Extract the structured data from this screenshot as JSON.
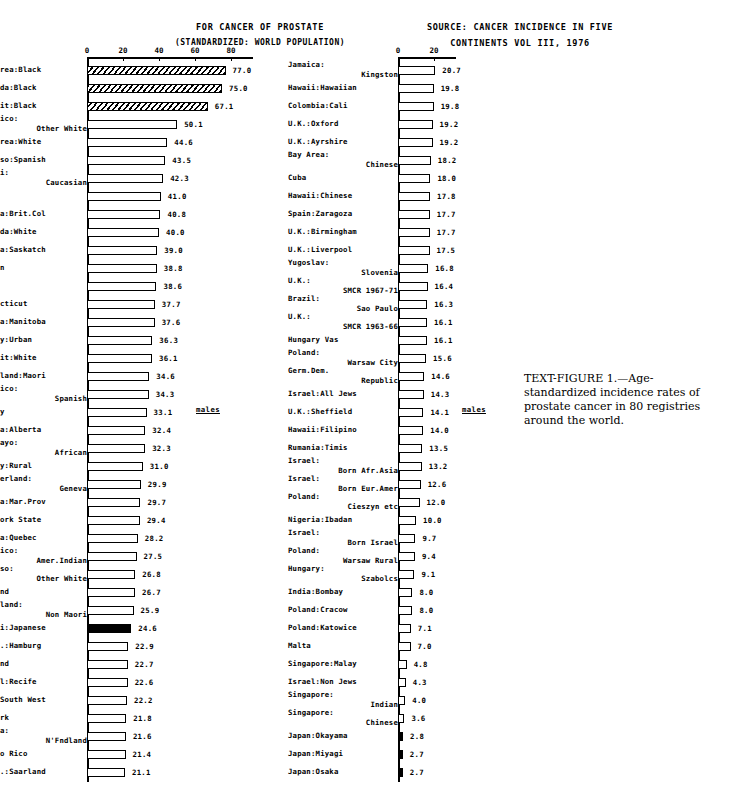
{
  "headers": {
    "left_line1": "FOR CANCER OF PROSTATE",
    "left_line2": "(STANDARDIZED: WORLD POPULATION)",
    "right_line1": "SOURCE: CANCER INCIDENCE IN FIVE",
    "right_line2": "CONTINENTS VOL III, 1976"
  },
  "annotations": {
    "males_left": "males",
    "males_right": "males"
  },
  "caption": {
    "lead": "TEXT-FIGURE",
    "number": "1.",
    "text": "—Age-standardized incidence rates of prostate cancer in 80 registries around the world."
  },
  "chart_data": {
    "type": "bar",
    "orientation": "horizontal",
    "title": "FOR CANCER OF PROSTATE",
    "subtitle": "(STANDARDIZED: WORLD POPULATION)",
    "source": "SOURCE: CANCER INCIDENCE IN FIVE CONTINENTS VOL III, 1976",
    "xlabel": "Age-standardized incidence rate per 100,000",
    "ylabel": "Registry",
    "xlim": [
      0,
      90
    ],
    "grid": false,
    "legend": "none",
    "sex": "males",
    "n_registries": 80,
    "panels": [
      {
        "name": "left",
        "axis_ticks": [
          0,
          20,
          40,
          60,
          80
        ],
        "categories": [
          "Bay Area:Black",
          "Alameda:Black",
          "Detroit:Black",
          "N.Mexico: Other White",
          "Bay Area:White",
          "El Paso:Spanish",
          "Hawaii: Caucasian",
          "Utah",
          "Canada:Brit.Col",
          "Alameda:White",
          "Canada:Saskatch",
          "Sweden",
          "Iowa",
          "Connecticut",
          "Canada:Manitoba",
          "Norway:Urban",
          "Detroit:White",
          "N.Zealand:Maori",
          "N.Mexico: Spanish",
          "Norway",
          "Canada:Alberta",
          "Bulawayo: African",
          "Norway:Rural",
          "Switzerland: Geneva",
          "Canada:Mar.Prov",
          "New York State",
          "Canada:Quebec",
          "N.Mexico: Amer.Indian",
          "El Paso: Other White",
          "Iceland",
          "N.Zealand: Non Maori",
          "Hawaii:Japanese",
          "F.R.G.:Hamburg",
          "Finland",
          "Brazil:Recife",
          "U.K.:South West",
          "Denmark",
          "Canada: N'Fndland",
          "Puerto Rico",
          "F.R.G.:Saarland"
        ],
        "values": [
          77.0,
          75.0,
          67.1,
          50.1,
          44.6,
          43.5,
          42.3,
          41.0,
          40.8,
          40.0,
          39.0,
          38.8,
          38.6,
          37.7,
          37.6,
          36.3,
          36.1,
          34.6,
          34.3,
          33.1,
          32.4,
          32.3,
          31.0,
          29.9,
          29.7,
          29.4,
          28.2,
          27.5,
          26.8,
          26.7,
          25.9,
          24.6,
          22.9,
          22.7,
          22.6,
          22.2,
          21.8,
          21.6,
          21.4,
          21.1
        ]
      },
      {
        "name": "right",
        "axis_ticks": [
          0,
          20
        ],
        "categories": [
          "Jamaica: Kingston",
          "Hawaii:Hawaiian",
          "Colombia:Cali",
          "U.K.:Oxford",
          "U.K.:Ayrshire",
          "Bay Area: Chinese",
          "Cuba",
          "Hawaii:Chinese",
          "Spain:Zaragoza",
          "U.K.:Birmingham",
          "U.K.:Liverpool",
          "Yugoslav: Slovenia",
          "U.K.: SMCR 1967-71",
          "Brazil: Sao Paulo",
          "U.K.: SMCR 1963-66",
          "Hungary Vas",
          "Poland: Warsaw City",
          "Germ.Dem. Republic",
          "Israel:All Jews",
          "U.K.:Sheffield",
          "Hawaii:Filipino",
          "Rumania:Timis",
          "Israel: Born Afr.Asia",
          "Israel: Born Eur.Amer",
          "Poland: Cieszyn etc",
          "Nigeria:Ibadan",
          "Israel: Born Israel",
          "Poland: Warsaw Rural",
          "Hungary: Szabolcs",
          "India:Bombay",
          "Poland:Cracow",
          "Poland:Katowice",
          "Malta",
          "Singapore:Malay",
          "Israel:Non Jews",
          "Singapore: Indian",
          "Singapore: Chinese",
          "Japan:Okayama",
          "Japan:Miyagi",
          "Japan:Osaka"
        ],
        "values": [
          20.7,
          19.8,
          19.8,
          19.2,
          19.2,
          18.2,
          18.0,
          17.8,
          17.7,
          17.7,
          17.5,
          16.8,
          16.4,
          16.3,
          16.1,
          16.1,
          15.6,
          14.6,
          14.3,
          14.1,
          14.0,
          13.5,
          13.2,
          12.6,
          12.0,
          10.0,
          9.7,
          9.4,
          9.1,
          8.0,
          8.0,
          7.1,
          7.0,
          4.8,
          4.3,
          4.0,
          3.6,
          2.8,
          2.7,
          2.7
        ]
      }
    ]
  },
  "rows": {
    "left": [
      {
        "l1": "Bay Area:Black",
        "l2": "",
        "v": 77.0,
        "t": "hatch"
      },
      {
        "l1": "Alameda:Black",
        "l2": "",
        "v": 75.0,
        "t": "hatch"
      },
      {
        "l1": "Detroit:Black",
        "l2": "",
        "v": 67.1,
        "t": "hatch"
      },
      {
        "l1": "N.Mexico:",
        "l2": "Other White",
        "v": 50.1,
        "t": "open"
      },
      {
        "l1": "Bay Area:White",
        "l2": "",
        "v": 44.6,
        "t": "open"
      },
      {
        "l1": "El Paso:Spanish",
        "l2": "",
        "v": 43.5,
        "t": "open"
      },
      {
        "l1": "Hawaii:",
        "l2": "Caucasian",
        "v": 42.3,
        "t": "open"
      },
      {
        "l1": "Utah",
        "l2": "",
        "v": 41.0,
        "t": "open"
      },
      {
        "l1": "Canada:Brit.Col",
        "l2": "",
        "v": 40.8,
        "t": "open"
      },
      {
        "l1": "Alameda:White",
        "l2": "",
        "v": 40.0,
        "t": "open"
      },
      {
        "l1": "Canada:Saskatch",
        "l2": "",
        "v": 39.0,
        "t": "open"
      },
      {
        "l1": "Sweden",
        "l2": "",
        "v": 38.8,
        "t": "open"
      },
      {
        "l1": "Iowa",
        "l2": "",
        "v": 38.6,
        "t": "open"
      },
      {
        "l1": "Connecticut",
        "l2": "",
        "v": 37.7,
        "t": "open"
      },
      {
        "l1": "Canada:Manitoba",
        "l2": "",
        "v": 37.6,
        "t": "open"
      },
      {
        "l1": "Norway:Urban",
        "l2": "",
        "v": 36.3,
        "t": "open"
      },
      {
        "l1": "Detroit:White",
        "l2": "",
        "v": 36.1,
        "t": "open"
      },
      {
        "l1": "N.Zealand:Maori",
        "l2": "",
        "v": 34.6,
        "t": "open"
      },
      {
        "l1": "N.Mexico:",
        "l2": "Spanish",
        "v": 34.3,
        "t": "open"
      },
      {
        "l1": "Norway",
        "l2": "",
        "v": 33.1,
        "t": "open"
      },
      {
        "l1": "Canada:Alberta",
        "l2": "",
        "v": 32.4,
        "t": "open"
      },
      {
        "l1": "Bulawayo:",
        "l2": "African",
        "v": 32.3,
        "t": "open"
      },
      {
        "l1": "Norway:Rural",
        "l2": "",
        "v": 31.0,
        "t": "open"
      },
      {
        "l1": "Switzerland:",
        "l2": "Geneva",
        "v": 29.9,
        "t": "open"
      },
      {
        "l1": "Canada:Mar.Prov",
        "l2": "",
        "v": 29.7,
        "t": "open"
      },
      {
        "l1": "New York State",
        "l2": "",
        "v": 29.4,
        "t": "open"
      },
      {
        "l1": "Canada:Quebec",
        "l2": "",
        "v": 28.2,
        "t": "open"
      },
      {
        "l1": "N.Mexico:",
        "l2": "Amer.Indian",
        "v": 27.5,
        "t": "open"
      },
      {
        "l1": "El Paso:",
        "l2": "Other White",
        "v": 26.8,
        "t": "open"
      },
      {
        "l1": "Iceland",
        "l2": "",
        "v": 26.7,
        "t": "open"
      },
      {
        "l1": "N.Zealand:",
        "l2": "Non Maori",
        "v": 25.9,
        "t": "open"
      },
      {
        "l1": "Hawaii:Japanese",
        "l2": "",
        "v": 24.6,
        "t": "solid"
      },
      {
        "l1": "F.R.G.:Hamburg",
        "l2": "",
        "v": 22.9,
        "t": "open"
      },
      {
        "l1": "Finland",
        "l2": "",
        "v": 22.7,
        "t": "open"
      },
      {
        "l1": "Brazil:Recife",
        "l2": "",
        "v": 22.6,
        "t": "open"
      },
      {
        "l1": "U.K.:South West",
        "l2": "",
        "v": 22.2,
        "t": "open"
      },
      {
        "l1": "Denmark",
        "l2": "",
        "v": 21.8,
        "t": "open"
      },
      {
        "l1": "Canada:",
        "l2": "N'Fndland",
        "v": 21.6,
        "t": "open"
      },
      {
        "l1": "Puerto Rico",
        "l2": "",
        "v": 21.4,
        "t": "open"
      },
      {
        "l1": "F.R.G.:Saarland",
        "l2": "",
        "v": 21.1,
        "t": "open"
      }
    ],
    "right": [
      {
        "l1": "Jamaica:",
        "l2": "Kingston",
        "v": 20.7,
        "t": "open"
      },
      {
        "l1": "Hawaii:Hawaiian",
        "l2": "",
        "v": 19.8,
        "t": "open"
      },
      {
        "l1": "Colombia:Cali",
        "l2": "",
        "v": 19.8,
        "t": "open"
      },
      {
        "l1": "U.K.:Oxford",
        "l2": "",
        "v": 19.2,
        "t": "open"
      },
      {
        "l1": "U.K.:Ayrshire",
        "l2": "",
        "v": 19.2,
        "t": "open"
      },
      {
        "l1": "Bay Area:",
        "l2": "Chinese",
        "v": 18.2,
        "t": "open"
      },
      {
        "l1": "Cuba",
        "l2": "",
        "v": 18.0,
        "t": "open"
      },
      {
        "l1": "Hawaii:Chinese",
        "l2": "",
        "v": 17.8,
        "t": "open"
      },
      {
        "l1": "Spain:Zaragoza",
        "l2": "",
        "v": 17.7,
        "t": "open"
      },
      {
        "l1": "U.K.:Birmingham",
        "l2": "",
        "v": 17.7,
        "t": "open"
      },
      {
        "l1": "U.K.:Liverpool",
        "l2": "",
        "v": 17.5,
        "t": "open"
      },
      {
        "l1": "Yugoslav:",
        "l2": "Slovenia",
        "v": 16.8,
        "t": "open"
      },
      {
        "l1": "U.K.:",
        "l2": "SMCR 1967-71",
        "v": 16.4,
        "t": "open"
      },
      {
        "l1": "Brazil:",
        "l2": "Sao Paulo",
        "v": 16.3,
        "t": "open"
      },
      {
        "l1": "U.K.:",
        "l2": "SMCR 1963-66",
        "v": 16.1,
        "t": "open"
      },
      {
        "l1": "Hungary Vas",
        "l2": "",
        "v": 16.1,
        "t": "open"
      },
      {
        "l1": "Poland:",
        "l2": "Warsaw City",
        "v": 15.6,
        "t": "open"
      },
      {
        "l1": "Germ.Dem.",
        "l2": "Republic",
        "v": 14.6,
        "t": "open"
      },
      {
        "l1": "Israel:All Jews",
        "l2": "",
        "v": 14.3,
        "t": "open"
      },
      {
        "l1": "U.K.:Sheffield",
        "l2": "",
        "v": 14.1,
        "t": "open"
      },
      {
        "l1": "Hawaii:Filipino",
        "l2": "",
        "v": 14.0,
        "t": "open"
      },
      {
        "l1": "Rumania:Timis",
        "l2": "",
        "v": 13.5,
        "t": "open"
      },
      {
        "l1": "Israel:",
        "l2": "Born Afr.Asia",
        "v": 13.2,
        "t": "open"
      },
      {
        "l1": "Israel:",
        "l2": "Born Eur.Amer",
        "v": 12.6,
        "t": "open"
      },
      {
        "l1": "Poland:",
        "l2": "Cieszyn etc",
        "v": 12.0,
        "t": "open"
      },
      {
        "l1": "Nigeria:Ibadan",
        "l2": "",
        "v": 10.0,
        "t": "open"
      },
      {
        "l1": "Israel:",
        "l2": "Born Israel",
        "v": 9.7,
        "t": "open"
      },
      {
        "l1": "Poland:",
        "l2": "Warsaw Rural",
        "v": 9.4,
        "t": "open"
      },
      {
        "l1": "Hungary:",
        "l2": "Szabolcs",
        "v": 9.1,
        "t": "open"
      },
      {
        "l1": "India:Bombay",
        "l2": "",
        "v": 8.0,
        "t": "open"
      },
      {
        "l1": "Poland:Cracow",
        "l2": "",
        "v": 8.0,
        "t": "open"
      },
      {
        "l1": "Poland:Katowice",
        "l2": "",
        "v": 7.1,
        "t": "open"
      },
      {
        "l1": "Malta",
        "l2": "",
        "v": 7.0,
        "t": "open"
      },
      {
        "l1": "Singapore:Malay",
        "l2": "",
        "v": 4.8,
        "t": "open"
      },
      {
        "l1": "Israel:Non Jews",
        "l2": "",
        "v": 4.3,
        "t": "open"
      },
      {
        "l1": "Singapore:",
        "l2": "Indian",
        "v": 4.0,
        "t": "open"
      },
      {
        "l1": "Singapore:",
        "l2": "Chinese",
        "v": 3.6,
        "t": "open"
      },
      {
        "l1": "Japan:Okayama",
        "l2": "",
        "v": 2.8,
        "t": "solid"
      },
      {
        "l1": "Japan:Miyagi",
        "l2": "",
        "v": 2.7,
        "t": "solid"
      },
      {
        "l1": "Japan:Osaka",
        "l2": "",
        "v": 2.7,
        "t": "solid"
      }
    ]
  }
}
